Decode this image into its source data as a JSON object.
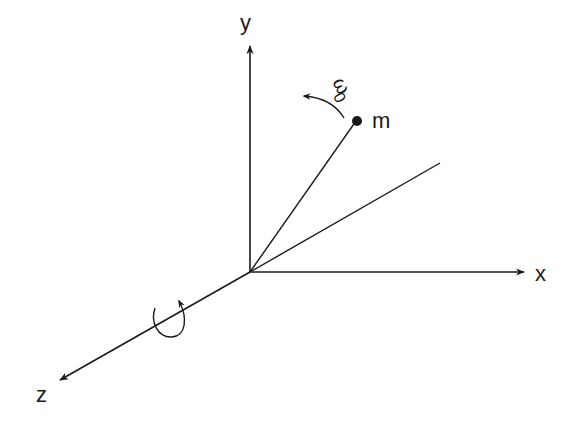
{
  "diagram": {
    "axes": {
      "x_label": "x",
      "y_label": "y",
      "z_label": "z"
    },
    "mass_label": "m",
    "angular_velocity_label": "ω",
    "angular_velocity_subscript": "0",
    "colors": {
      "line": "#1a1a1a",
      "background": "#ffffff"
    }
  }
}
